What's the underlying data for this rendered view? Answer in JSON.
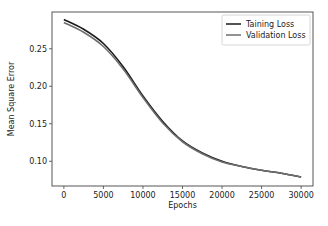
{
  "chart_data": {
    "type": "line",
    "title": "",
    "xlabel": "Epochs",
    "ylabel": "Mean Square Error",
    "xlim": [
      -1500,
      31500
    ],
    "ylim": [
      0.067,
      0.299
    ],
    "xticks": [
      0,
      5000,
      10000,
      15000,
      20000,
      25000,
      30000
    ],
    "xtick_labels": [
      "0",
      "5000",
      "10000",
      "15000",
      "20000",
      "25000",
      "30000"
    ],
    "yticks": [
      0.1,
      0.15,
      0.2,
      0.25
    ],
    "ytick_labels": [
      "0.10",
      "0.15",
      "0.20",
      "0.25"
    ],
    "grid": false,
    "legend_position": "upper right",
    "x": [
      0,
      2500,
      5000,
      7500,
      10000,
      12500,
      15000,
      17500,
      20000,
      22500,
      25000,
      27500,
      30000
    ],
    "series": [
      {
        "name": "Taining Loss",
        "color": "#1a1a1a",
        "values": [
          0.289,
          0.276,
          0.257,
          0.226,
          0.187,
          0.153,
          0.127,
          0.111,
          0.1,
          0.093,
          0.088,
          0.084,
          0.079
        ]
      },
      {
        "name": "Validation Loss",
        "color": "#6e6e6e",
        "values": [
          0.285,
          0.272,
          0.253,
          0.223,
          0.185,
          0.151,
          0.126,
          0.11,
          0.099,
          0.093,
          0.088,
          0.084,
          0.079
        ]
      }
    ]
  },
  "layout": {
    "plot": {
      "left": 52,
      "top": 12,
      "right": 313,
      "bottom": 186
    },
    "legend": {
      "x": 222,
      "y": 15,
      "w": 88,
      "h": 30
    }
  }
}
